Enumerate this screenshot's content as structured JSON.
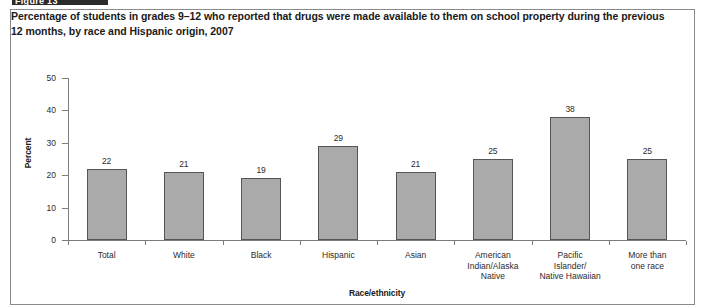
{
  "header_strip": {
    "label": "Figure 13"
  },
  "figure": {
    "title": "Percentage of students in grades 9–12 who reported that drugs were made available to them on school property during the previous 12 months, by race and Hispanic origin, 2007"
  },
  "colors": {
    "bar_fill": "#aaaaaa",
    "bar_border": "#555555",
    "axis": "#7d7d7d",
    "text": "#2b2b2b",
    "frame": "#8a8a8a"
  },
  "chart_data": {
    "type": "bar",
    "title": "Percentage of students in grades 9–12 who reported that drugs were made available to them on school property during the previous 12 months, by race and Hispanic origin, 2007",
    "xlabel": "Race/ethnicity",
    "ylabel": "Percent",
    "ylim": [
      0,
      50
    ],
    "yticks": [
      0,
      10,
      20,
      30,
      40,
      50
    ],
    "ytick_labels": [
      "0",
      "10",
      "20",
      "30",
      "40",
      "50"
    ],
    "grid": false,
    "legend": null,
    "categories": [
      "Total",
      "White",
      "Black",
      "Hispanic",
      "Asian",
      "American\nIndian/Alaska\nNative",
      "Pacific\nIslander/\nNative Hawaiian",
      "More than\none race"
    ],
    "values": [
      22,
      21,
      19,
      29,
      21,
      25,
      38,
      25
    ],
    "value_labels": [
      "22",
      "21",
      "19",
      "29",
      "21",
      "25",
      "38",
      "25"
    ]
  }
}
